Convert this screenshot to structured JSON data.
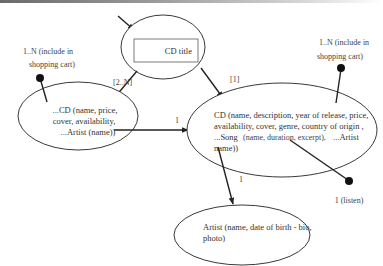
{
  "diagram": {
    "nodes": {
      "cd_title": {
        "label": "CD title"
      },
      "cd_list": {
        "lines": [
          "...CD (name, price,",
          "cover, availability,",
          "...Artist (name))"
        ]
      },
      "cd_detail": {
        "lines": [
          "CD (name, description, year of release, price,",
          "availability,  cover, genre, country of origin ,",
          "...Song",
          "(name, duration, excerpt),",
          "...Artist",
          "name))"
        ]
      },
      "artist": {
        "lines": [
          "Artist (name, date of birth - bio,",
          "photo)"
        ]
      }
    },
    "edges": {
      "title_to_list": {
        "label": "[2..N]"
      },
      "title_to_detail": {
        "label": "[1]"
      },
      "list_to_detail": {
        "label": "1"
      },
      "detail_to_artist": {
        "label": "1"
      }
    },
    "annotations": {
      "list_cart": {
        "lines": [
          "1..N (include in",
          "shopping cart)"
        ]
      },
      "detail_cart": {
        "lines": [
          "1..N (include in",
          "shopping cart)"
        ]
      },
      "listen": {
        "label": "1 (listen)"
      }
    },
    "colors": {
      "stroke": "#222222",
      "text": "#333333",
      "background": "#ffffff"
    }
  }
}
